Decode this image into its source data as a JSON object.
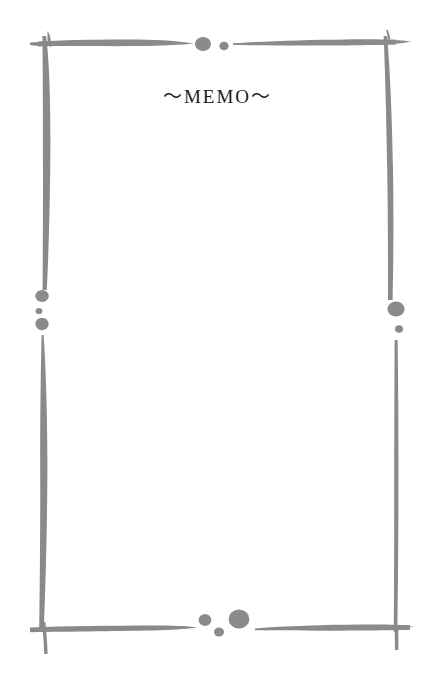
{
  "page": {
    "width": 435,
    "height": 677,
    "background_color": "#ffffff",
    "kind": "blank-memo-stationery"
  },
  "title": {
    "text": "～MEMO～",
    "plain_text": "~MEMO~",
    "color": "#1c1c1c",
    "font_size_px": 19,
    "letter_spacing_px": 2,
    "align": "center"
  },
  "body": {
    "content": "",
    "placeholder": ""
  },
  "frame": {
    "style": "hand-drawn-brush-stroke-border",
    "stroke_color": "#8a8a8a",
    "strokes": [
      {
        "name": "top-left-horizontal",
        "orientation": "horizontal",
        "taper": "thick-at-corner-to-point"
      },
      {
        "name": "top-right-horizontal",
        "orientation": "horizontal",
        "taper": "point-to-thick-at-corner"
      },
      {
        "name": "left-upper-vertical",
        "orientation": "vertical",
        "taper": "thick-at-top-to-thin"
      },
      {
        "name": "left-lower-vertical",
        "orientation": "vertical",
        "taper": "point-to-wide-to-point"
      },
      {
        "name": "right-upper-vertical",
        "orientation": "vertical",
        "taper": "thick-at-top-to-thin"
      },
      {
        "name": "right-lower-vertical",
        "orientation": "vertical",
        "taper": "thin-even"
      },
      {
        "name": "bottom-left-horizontal",
        "orientation": "horizontal",
        "taper": "thick-at-corner-to-point"
      },
      {
        "name": "bottom-right-horizontal",
        "orientation": "horizontal",
        "taper": "point-to-thick-at-corner"
      }
    ],
    "corners": [
      {
        "name": "corner-top-left",
        "shape": "cross"
      },
      {
        "name": "corner-top-right",
        "shape": "cross"
      },
      {
        "name": "corner-bottom-left",
        "shape": "cross"
      },
      {
        "name": "corner-bottom-right",
        "shape": "cross"
      }
    ],
    "dots": [
      {
        "name": "dot-top-large",
        "cx": 203,
        "cy": 44,
        "rx": 8.0,
        "ry": 7.0
      },
      {
        "name": "dot-top-small",
        "cx": 224,
        "cy": 46,
        "rx": 4.6,
        "ry": 4.2
      },
      {
        "name": "dot-left-upper-medium",
        "cx": 42,
        "cy": 296,
        "rx": 6.8,
        "ry": 6.0
      },
      {
        "name": "dot-left-middle-tiny",
        "cx": 39,
        "cy": 311,
        "rx": 3.4,
        "ry": 3.1
      },
      {
        "name": "dot-left-lower-medium",
        "cx": 42,
        "cy": 324,
        "rx": 6.6,
        "ry": 6.2
      },
      {
        "name": "dot-right-large",
        "cx": 396,
        "cy": 309,
        "rx": 8.6,
        "ry": 7.6
      },
      {
        "name": "dot-right-small",
        "cx": 399,
        "cy": 329,
        "rx": 4.0,
        "ry": 3.8
      },
      {
        "name": "dot-bottom-medium",
        "cx": 205,
        "cy": 620,
        "rx": 6.4,
        "ry": 6.0
      },
      {
        "name": "dot-bottom-small",
        "cx": 219,
        "cy": 632,
        "rx": 5.0,
        "ry": 4.6
      },
      {
        "name": "dot-bottom-large",
        "cx": 239,
        "cy": 619,
        "rx": 10.4,
        "ry": 9.6
      }
    ]
  }
}
